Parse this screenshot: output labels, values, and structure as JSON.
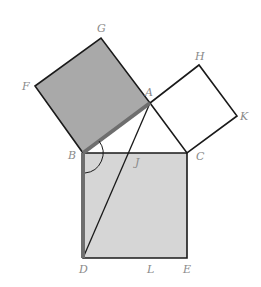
{
  "diagram": {
    "colors": {
      "stroke": "#1a1a1a",
      "highlight_stroke": "#6e6e6e",
      "square_on_AB_fill": "#a9a9a9",
      "rect_BDLJ_fill": "#d6d6d6",
      "label": "#8a8a8a"
    },
    "points": {
      "A": {
        "label": "A",
        "x": 150,
        "y": 103
      },
      "B": {
        "label": "B",
        "x": 83,
        "y": 153
      },
      "C": {
        "label": "C",
        "x": 187,
        "y": 153
      },
      "D": {
        "label": "D",
        "x": 83,
        "y": 258
      },
      "E": {
        "label": "E",
        "x": 187,
        "y": 258
      },
      "F": {
        "label": "F",
        "x": 35,
        "y": 86
      },
      "G": {
        "label": "G",
        "x": 101,
        "y": 38
      },
      "H": {
        "label": "H",
        "x": 199,
        "y": 65
      },
      "K": {
        "label": "K",
        "x": 237,
        "y": 116
      },
      "J": {
        "label": "J",
        "x": 150,
        "y": 153
      },
      "L": {
        "label": "L",
        "x": 150,
        "y": 258
      }
    },
    "labels": [
      {
        "id": "G",
        "text": "G",
        "x": 97,
        "y": 32
      },
      {
        "id": "F",
        "text": "F",
        "x": 22,
        "y": 90
      },
      {
        "id": "A",
        "text": "A",
        "x": 145,
        "y": 96
      },
      {
        "id": "H",
        "text": "H",
        "x": 195,
        "y": 60
      },
      {
        "id": "K",
        "text": "K",
        "x": 240,
        "y": 120
      },
      {
        "id": "B",
        "text": "B",
        "x": 68,
        "y": 159
      },
      {
        "id": "C",
        "text": "C",
        "x": 196,
        "y": 160
      },
      {
        "id": "J",
        "text": "J",
        "x": 135,
        "y": 166
      },
      {
        "id": "D",
        "text": "D",
        "x": 79,
        "y": 273
      },
      {
        "id": "L",
        "text": "L",
        "x": 147,
        "y": 273
      },
      {
        "id": "E",
        "text": "E",
        "x": 183,
        "y": 273
      }
    ],
    "shapes": [
      {
        "name": "square-ABFG",
        "type": "square",
        "vertices": [
          "A",
          "B",
          "F",
          "G"
        ],
        "fill": "shaded-dark"
      },
      {
        "name": "square-ACKH",
        "type": "square",
        "vertices": [
          "A",
          "C",
          "K",
          "H"
        ],
        "fill": "none"
      },
      {
        "name": "square-BCED",
        "type": "square",
        "vertices": [
          "B",
          "C",
          "E",
          "D"
        ],
        "fill": "none"
      },
      {
        "name": "rect-BDLJ",
        "type": "rectangle",
        "vertices": [
          "B",
          "J",
          "L",
          "D"
        ],
        "fill": "shaded-light"
      },
      {
        "name": "segment-AD",
        "type": "line",
        "vertices": [
          "A",
          "D"
        ]
      },
      {
        "name": "segment-AB-highlight",
        "type": "thick-line",
        "vertices": [
          "A",
          "B"
        ]
      },
      {
        "name": "segment-BD-highlight",
        "type": "thick-line",
        "vertices": [
          "B",
          "D"
        ]
      },
      {
        "name": "angle-DBA",
        "type": "arc",
        "vertices": [
          "D",
          "B",
          "A"
        ]
      }
    ]
  }
}
